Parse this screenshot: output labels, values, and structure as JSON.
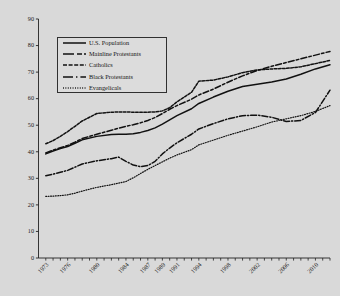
{
  "chart_data": {
    "type": "line",
    "title": "",
    "subtitle": "",
    "xlabel": "",
    "ylabel": "",
    "xlim": [
      1972,
      2012
    ],
    "ylim": [
      0,
      90
    ],
    "yticks": [
      0,
      10,
      20,
      30,
      40,
      50,
      60,
      70,
      80,
      90
    ],
    "ytick_labels": [
      "0",
      "10",
      "20",
      "30",
      "40",
      "50",
      "60",
      "70",
      "80",
      "90"
    ],
    "xticks": [
      1973,
      1976,
      1980,
      1984,
      1987,
      1989,
      1991,
      1994,
      1998,
      2002,
      2006,
      2010
    ],
    "xtick_labels": [
      "1973",
      "1976",
      "1980",
      "1984",
      "1987",
      "1989",
      "1991",
      "1994",
      "1998",
      "2002",
      "2006",
      "2010"
    ],
    "grid": false,
    "legend_position": "upper-left",
    "x": [
      1973,
      1974,
      1975,
      1976,
      1977,
      1978,
      1980,
      1982,
      1983,
      1984,
      1985,
      1986,
      1987,
      1988,
      1989,
      1990,
      1991,
      1993,
      1994,
      1996,
      1998,
      2000,
      2002,
      2004,
      2006,
      2008,
      2010,
      2012
    ],
    "series": [
      {
        "name": "U.S. Population",
        "style": "solid",
        "color": "#111111",
        "values": [
          39.2,
          40.3,
          41.2,
          42.0,
          43.2,
          44.5,
          45.8,
          46.5,
          46.6,
          46.6,
          46.8,
          47.3,
          48.0,
          49.0,
          50.4,
          52.0,
          53.6,
          56.2,
          58.2,
          60.6,
          62.8,
          64.6,
          65.4,
          66.3,
          67.4,
          69.2,
          71.2,
          72.8
        ]
      },
      {
        "name": "Mainline Protestants",
        "style": "dashed",
        "color": "#111111",
        "values": [
          39.6,
          40.6,
          41.5,
          42.4,
          43.6,
          45.0,
          46.6,
          48.1,
          48.9,
          49.6,
          50.2,
          50.9,
          51.8,
          52.9,
          54.4,
          56.0,
          57.4,
          59.8,
          61.4,
          63.6,
          66.2,
          68.6,
          70.6,
          72.2,
          73.6,
          75.0,
          76.4,
          77.8
        ]
      },
      {
        "name": "Catholics",
        "style": "dashdot-short",
        "color": "#111111",
        "values": [
          43.0,
          44.2,
          45.8,
          47.6,
          49.6,
          51.6,
          54.4,
          54.9,
          55.0,
          55.0,
          54.9,
          54.9,
          54.9,
          55.0,
          55.4,
          56.6,
          58.8,
          62.4,
          66.6,
          67.0,
          68.2,
          69.8,
          70.8,
          71.2,
          71.4,
          72.0,
          73.2,
          74.4
        ]
      },
      {
        "name": "Black Protestants",
        "style": "dashdot",
        "color": "#111111",
        "values": [
          31.0,
          31.6,
          32.3,
          33.0,
          34.2,
          35.4,
          36.6,
          37.4,
          38.0,
          36.4,
          35.0,
          34.4,
          34.8,
          36.4,
          39.2,
          41.4,
          43.4,
          46.6,
          48.6,
          50.6,
          52.4,
          53.6,
          53.8,
          53.0,
          51.4,
          51.8,
          54.8,
          63.2
        ]
      },
      {
        "name": "Evangelicals",
        "style": "dotted",
        "color": "#111111",
        "values": [
          23.2,
          23.3,
          23.5,
          23.8,
          24.4,
          25.2,
          26.6,
          27.6,
          28.2,
          28.8,
          30.2,
          31.8,
          33.4,
          34.8,
          36.2,
          37.6,
          38.8,
          40.8,
          42.6,
          44.4,
          46.2,
          47.8,
          49.4,
          51.2,
          52.4,
          53.6,
          55.2,
          57.4
        ]
      }
    ]
  },
  "legend": {
    "items": [
      {
        "label": "U.S. Population"
      },
      {
        "label": "Mainline Protestants"
      },
      {
        "label": "Catholics"
      },
      {
        "label": "Black Protestants"
      },
      {
        "label": "Evangelicals"
      }
    ]
  }
}
